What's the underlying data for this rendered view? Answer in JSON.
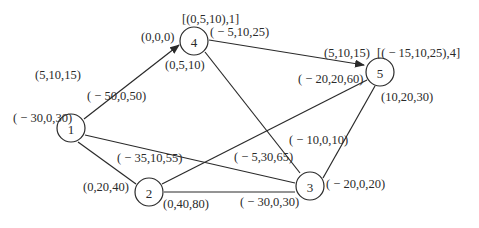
{
  "diagram": {
    "type": "network-graph",
    "nodes": [
      {
        "id": "1",
        "label": "1",
        "cx": 71,
        "cy": 128
      },
      {
        "id": "2",
        "label": "2",
        "cx": 149,
        "cy": 192
      },
      {
        "id": "3",
        "label": "3",
        "cx": 310,
        "cy": 186
      },
      {
        "id": "4",
        "label": "4",
        "cx": 194,
        "cy": 41
      },
      {
        "id": "5",
        "label": "5",
        "cx": 380,
        "cy": 72
      }
    ],
    "edges": [
      {
        "from": "1",
        "to": "4",
        "directed": true
      },
      {
        "from": "4",
        "to": "5",
        "directed": true
      },
      {
        "from": "1",
        "to": "2",
        "directed": false
      },
      {
        "from": "1",
        "to": "3",
        "directed": false
      },
      {
        "from": "4",
        "to": "3",
        "directed": false
      },
      {
        "from": "2",
        "to": "5",
        "directed": false
      },
      {
        "from": "2",
        "to": "3",
        "directed": false
      },
      {
        "from": "5",
        "to": "3",
        "directed": false
      }
    ],
    "labels": {
      "n4_top": "[(0,5,10),1]",
      "n4_left": "(0,0,0)",
      "n4_right": "( − 5,10,25)",
      "n4_below": "(0,5,10)",
      "n5_topleft": "(5,10,15)",
      "n5_topright": "[( − 15,10,25),4]",
      "n5_left": "( − 20,20,60)",
      "n5_below": "(10,20,30)",
      "n1_top": "(5,10,15)",
      "n1_right": "( − 50,0,50)",
      "n1_below": "( − 30,0,30)",
      "n2_above": "( − 35,10,55)",
      "n2_left": "(0,20,40)",
      "n2_below": "(0,40,80)",
      "n3_upper": "( − 10,0,10)",
      "n3_left": "( − 5,30,65)",
      "n3_right": "( − 20,0,20)",
      "n3_below": "( − 30,0,30)"
    }
  }
}
